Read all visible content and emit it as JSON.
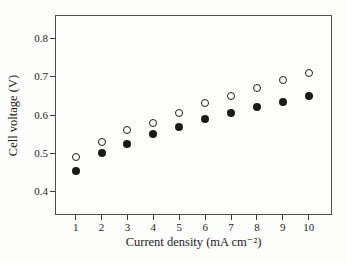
{
  "chart_data": {
    "type": "scatter",
    "title": "",
    "xlabel": "Current density (mA cm⁻²)",
    "ylabel": "Cell voltage (V)",
    "xlim": [
      0.2,
      10.9
    ],
    "ylim": [
      0.34,
      0.86
    ],
    "x_ticks": [
      "1",
      "2",
      "3",
      "4",
      "5",
      "6",
      "7",
      "8",
      "9",
      "10"
    ],
    "y_ticks": [
      "0.4",
      "0.5",
      "0.6",
      "0.7",
      "0.8"
    ],
    "grid": false,
    "legend": "none",
    "x": [
      1,
      2,
      3,
      4,
      5,
      6,
      7,
      8,
      9,
      10
    ],
    "series": [
      {
        "name": "open circles",
        "marker": "open-circle",
        "stroke": "#1a1a1a",
        "fill": "#fefefd",
        "values": [
          0.49,
          0.53,
          0.56,
          0.58,
          0.605,
          0.63,
          0.65,
          0.67,
          0.69,
          0.71
        ]
      },
      {
        "name": "filled circles",
        "marker": "filled-circle",
        "stroke": "#1a1a1a",
        "fill": "#1a1a1a",
        "values": [
          0.455,
          0.5,
          0.525,
          0.55,
          0.57,
          0.59,
          0.605,
          0.62,
          0.635,
          0.65
        ]
      }
    ],
    "colors": {
      "frame": "#4f4f4f",
      "text": "#1c1c1c",
      "background": "#fdfdfb"
    }
  }
}
